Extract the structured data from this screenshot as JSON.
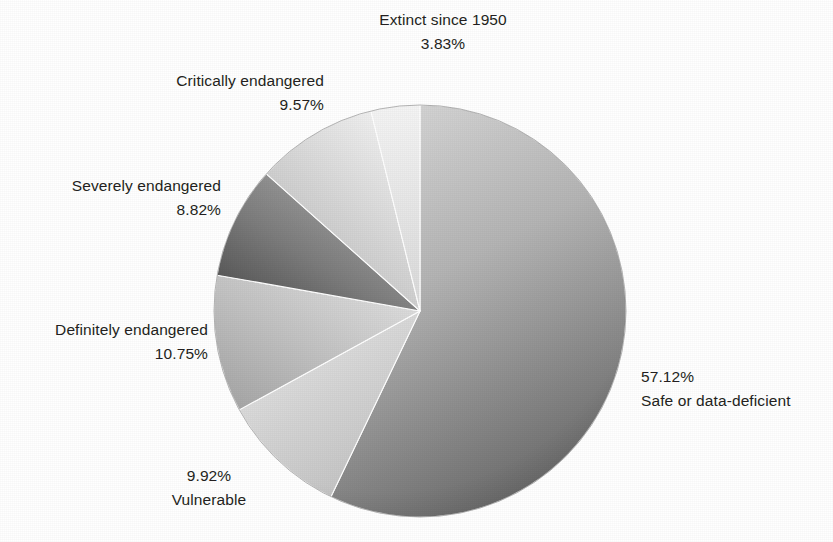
{
  "chart_data": {
    "type": "pie",
    "title": "",
    "subtitle": "",
    "xlabel": "",
    "ylabel": "",
    "legend_position": "none",
    "grid": false,
    "labels_outside": true,
    "start_angle_deg": 0,
    "direction": "clockwise",
    "units": "percent",
    "categories": [
      "Safe or data-deficient",
      "Vulnerable",
      "Definitely endangered",
      "Severely endangered",
      "Critically endangered",
      "Extinct since 1950"
    ],
    "values": [
      57.12,
      9.92,
      10.75,
      8.82,
      9.57,
      3.83
    ],
    "value_labels": [
      "57.12%",
      "9.92%",
      "10.75%",
      "8.82%",
      "9.57%",
      "3.83%"
    ],
    "slices": [
      {
        "name": "Safe or data-deficient",
        "value": 57.12,
        "value_label": "57.12%",
        "color_from": "#d2d2d2",
        "color_to": "#6e6e6e"
      },
      {
        "name": "Vulnerable",
        "value": 9.92,
        "value_label": "9.92%",
        "color_from": "#e4e4e4",
        "color_to": "#c2c2c2"
      },
      {
        "name": "Definitely endangered",
        "value": 10.75,
        "value_label": "10.75%",
        "color_from": "#d8d8d8",
        "color_to": "#ababab"
      },
      {
        "name": "Severely endangered",
        "value": 8.82,
        "value_label": "8.82%",
        "color_from": "#a8a8a8",
        "color_to": "#4f4f4f"
      },
      {
        "name": "Critically endangered",
        "value": 9.57,
        "value_label": "9.57%",
        "color_from": "#ededed",
        "color_to": "#b9b9b9"
      },
      {
        "name": "Extinct since 1950",
        "value": 3.83,
        "value_label": "3.83%",
        "color_from": "#f2f2f2",
        "color_to": "#dcdcdc"
      }
    ]
  },
  "labels": {
    "extinct": {
      "name": "Extinct since 1950",
      "pct": "3.83%"
    },
    "critically": {
      "name": "Critically endangered",
      "pct": "9.57%"
    },
    "severely": {
      "name": "Severely endangered",
      "pct": "8.82%"
    },
    "definitely": {
      "name": "Definitely endangered",
      "pct": "10.75%"
    },
    "vulnerable": {
      "name": "Vulnerable",
      "pct": "9.92%"
    },
    "safe": {
      "name": "Safe or data-deficient",
      "pct": "57.12%"
    }
  },
  "style": {
    "background": "#ffffff",
    "text_color": "#231f20"
  }
}
